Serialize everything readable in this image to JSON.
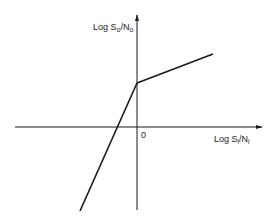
{
  "diagram": {
    "type": "piecewise-linear-transfer-curve",
    "y_axis": {
      "label_main": "Log S",
      "label_sub1": "o",
      "label_mid": "/N",
      "label_sub2": "o",
      "full_label": "Log So/No"
    },
    "x_axis": {
      "label_main": "Log S",
      "label_sub1": "i",
      "label_mid": "/N",
      "label_sub2": "i",
      "full_label": "Log Si/Ni"
    },
    "origin_label": "0",
    "colors": {
      "background": "#ffffff",
      "line": "#1a1a1a"
    },
    "geometry": {
      "origin": [
        137,
        127
      ],
      "y_axis_top": [
        137,
        15
      ],
      "y_axis_bottom": [
        137,
        210
      ],
      "x_axis_left": [
        15,
        127
      ],
      "x_axis_right": [
        262,
        127
      ],
      "knee": [
        137,
        83
      ],
      "upper_segment_end": [
        213,
        54
      ],
      "lower_segment_end": [
        80,
        211
      ]
    }
  }
}
